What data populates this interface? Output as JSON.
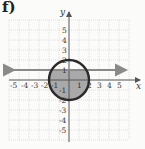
{
  "problem_label": "f)",
  "axes": {
    "x_label": "x",
    "y_label": "y",
    "x_ticks": [
      "-5",
      "-4",
      "-3",
      "-2",
      "-1",
      "1",
      "2",
      "3",
      "4",
      "5"
    ],
    "y_ticks": [
      "5",
      "4",
      "3",
      "2",
      "1",
      "-1",
      "-2",
      "-3",
      "-4",
      "-5"
    ],
    "range": [
      -6,
      6
    ]
  },
  "shapes": {
    "circle": {
      "center": [
        0,
        0
      ],
      "radius": 2,
      "style": "solid"
    },
    "line": {
      "equation": "y = 1",
      "style": "solid, arrows both ends"
    },
    "shaded_region": "inside circle and below y = 1"
  },
  "colors": {
    "grid": "#c8c8c8",
    "circle_stroke": "#2a2a2a",
    "line_stroke": "#8a8a8a",
    "shade": "#a8a8a8"
  }
}
